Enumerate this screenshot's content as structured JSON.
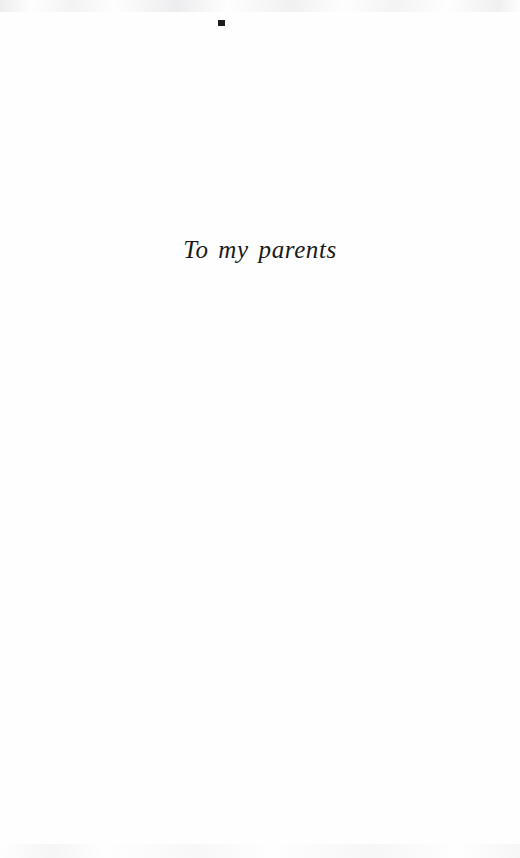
{
  "page": {
    "kind": "book-dedication-page",
    "background_color": "#fefefe",
    "ink_color": "#1a1a1a",
    "width": 520,
    "height": 858
  },
  "dedication": {
    "text": "To my parents"
  },
  "artifacts": {
    "speck_label": "",
    "top_band_label": "",
    "bottom_band_label": ""
  }
}
